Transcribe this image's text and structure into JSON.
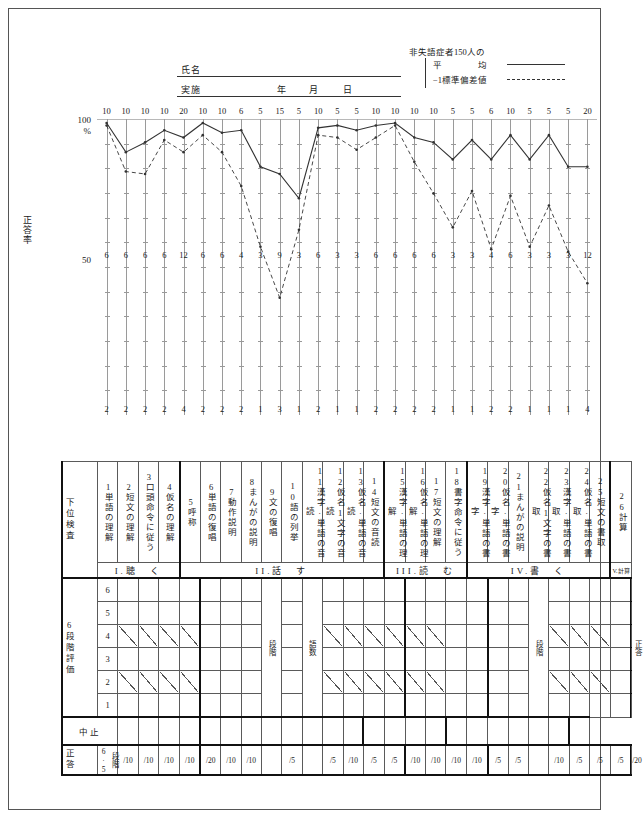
{
  "header": {
    "name_label": "氏名",
    "date_label": "実施",
    "year_label": "年",
    "month_label": "月",
    "day_label": "日"
  },
  "legend": {
    "title": "非失語症者150人の",
    "entries": [
      {
        "label": "平　　　　均",
        "style": "solid"
      },
      {
        "label": "−1標準偏差値",
        "style": "dashed"
      }
    ]
  },
  "chart_data": {
    "type": "line",
    "title": "",
    "ylabel": "正答率",
    "yticks": [
      "100",
      "%",
      "50"
    ],
    "ylim": [
      0,
      100
    ],
    "grid": true,
    "categories": [
      "1",
      "2",
      "3",
      "4",
      "5",
      "6",
      "7",
      "8",
      "9",
      "10",
      "11",
      "12",
      "13",
      "14",
      "15",
      "16",
      "17",
      "18",
      "19",
      "20",
      "21",
      "22",
      "23",
      "24",
      "25",
      "26"
    ],
    "row_top": [
      10,
      10,
      10,
      10,
      20,
      10,
      10,
      6,
      5,
      15,
      5,
      10,
      5,
      5,
      10,
      10,
      10,
      10,
      5,
      5,
      6,
      10,
      5,
      5,
      5,
      20
    ],
    "row_mid": [
      6,
      6,
      6,
      6,
      12,
      6,
      6,
      4,
      3,
      9,
      3,
      6,
      3,
      3,
      6,
      6,
      6,
      6,
      3,
      3,
      4,
      6,
      3,
      3,
      3,
      12
    ],
    "row_bot": [
      2,
      2,
      2,
      2,
      4,
      2,
      2,
      2,
      1,
      3,
      1,
      2,
      1,
      1,
      2,
      2,
      2,
      2,
      1,
      1,
      2,
      2,
      1,
      1,
      1,
      4
    ],
    "series": [
      {
        "name": "平均",
        "style": "solid",
        "values": [
          100,
          88,
          92,
          97,
          94,
          100,
          96,
          97,
          82,
          79,
          69,
          98,
          99,
          97,
          99,
          100,
          94,
          92,
          85,
          93,
          85,
          95,
          85,
          95,
          82,
          82
        ]
      },
      {
        "name": "−1標準偏差値",
        "style": "dashed",
        "values": [
          99,
          80,
          79,
          93,
          88,
          95,
          88,
          74,
          49,
          28,
          56,
          95,
          94,
          89,
          94,
          99,
          84,
          71,
          57,
          72,
          48,
          70,
          49,
          66,
          47,
          34
        ]
      }
    ]
  },
  "table": {
    "row_labels": {
      "subtest": "下位検査",
      "rating": "6段階評価",
      "discontinue": "中止",
      "correct": "正答",
      "correct_sub": "段階6·5"
    },
    "levels": [
      "6",
      "5",
      "4",
      "3",
      "2",
      "1"
    ],
    "subtests": [
      {
        "no": "1",
        "name": "単語の理解"
      },
      {
        "no": "2",
        "name": "短文の理解"
      },
      {
        "no": "3",
        "name": "口頭命令に従う"
      },
      {
        "no": "4",
        "name": "仮名の理解"
      },
      {
        "no": "5",
        "name": "呼称"
      },
      {
        "no": "6",
        "name": "単語の復唱"
      },
      {
        "no": "7",
        "name": "動作説明"
      },
      {
        "no": "8",
        "name": "まんがの説明"
      },
      {
        "no": "9",
        "name": "文の復唱"
      },
      {
        "no": "10",
        "name": "語の列挙"
      },
      {
        "no": "11",
        "name": "漢字·単語の音読"
      },
      {
        "no": "12",
        "name": "仮名1文字の音読"
      },
      {
        "no": "13",
        "name": "仮名·単語の音読"
      },
      {
        "no": "14",
        "name": "短文の音読"
      },
      {
        "no": "15",
        "name": "漢字·単語の理解"
      },
      {
        "no": "16",
        "name": "仮名·単語の理解"
      },
      {
        "no": "17",
        "name": "短文の理解"
      },
      {
        "no": "18",
        "name": "書字命令に従う"
      },
      {
        "no": "19",
        "name": "漢字·単語の書字"
      },
      {
        "no": "20",
        "name": "仮名·単語の書字"
      },
      {
        "no": "21",
        "name": "まんがの説明"
      },
      {
        "no": "22",
        "name": "仮名1文字の書取"
      },
      {
        "no": "23",
        "name": "漢字·単語の書取"
      },
      {
        "no": "24",
        "name": "仮名·単語の書取"
      },
      {
        "no": "25",
        "name": "短文の書取"
      },
      {
        "no": "26",
        "name": "計算"
      }
    ],
    "sections": [
      {
        "label": "I.聴　く",
        "span": 4
      },
      {
        "label": "II.話　す",
        "span": 10
      },
      {
        "label": "III.読　む",
        "span": 4
      },
      {
        "label": "IV.書　く",
        "span": 7
      },
      {
        "label": "V.計算",
        "span": 1,
        "small": true
      }
    ],
    "denominators": [
      "/10",
      "/10",
      "/10",
      "/10",
      "/20",
      "/10",
      "/10",
      "",
      "/5",
      "",
      "/5",
      "/10",
      "/5",
      "/5",
      "/10",
      "/10",
      "/10",
      "/10",
      "/5",
      "/5",
      "",
      "/10",
      "/5",
      "/5",
      "/5",
      "/20"
    ],
    "special_columns": [
      {
        "index": 8,
        "text": "段階"
      },
      {
        "index": 10,
        "text": "語数"
      },
      {
        "index": 21,
        "text": "段階"
      },
      {
        "index": 26,
        "text": "正答"
      }
    ]
  }
}
